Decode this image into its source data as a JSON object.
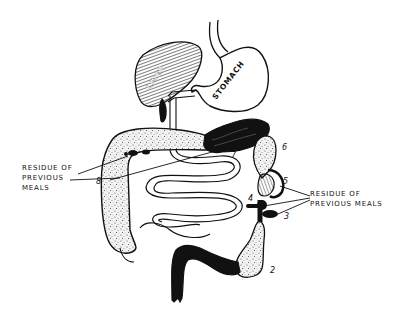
{
  "diagram": {
    "organs": {
      "liver": "LIVER",
      "stomach": "STOMACH"
    },
    "callouts": {
      "left": [
        "RESIDUE OF",
        "PREVIOUS",
        "MEALS"
      ],
      "right": [
        "RESIDUE OF",
        "PREVIOUS MEALS"
      ]
    },
    "markers": {
      "m1": "1",
      "m2": "2",
      "m3": "3",
      "m4": "4",
      "m5": "5",
      "m6": "6",
      "m7": "7",
      "m8": "8"
    },
    "colors": {
      "ink": "#111111",
      "paper": "#ffffff",
      "stipple": "#e9e9e9"
    }
  }
}
